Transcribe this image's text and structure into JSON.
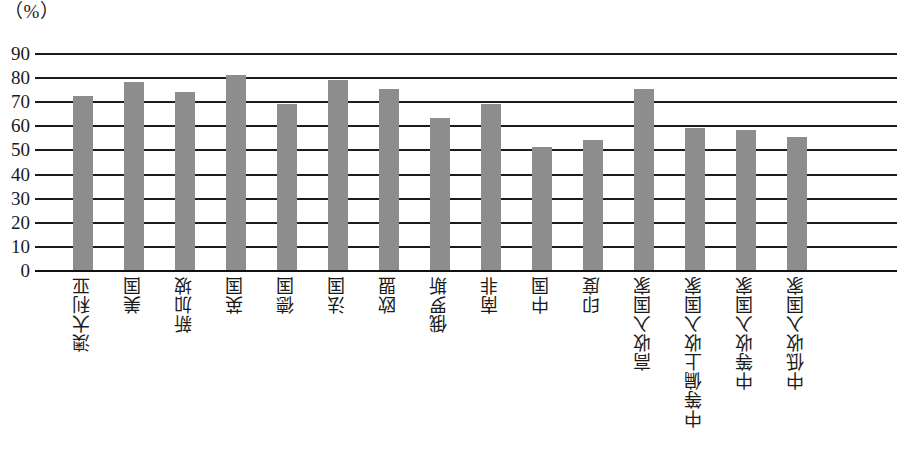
{
  "chart_data": {
    "type": "bar",
    "title": "",
    "subtitle": "",
    "xlabel": "",
    "ylabel": "",
    "unit_label": "（%）",
    "ylim": [
      0,
      90
    ],
    "ytick_step": 10,
    "yticks": [
      "90",
      "80",
      "70",
      "60",
      "50",
      "40",
      "30",
      "20",
      "10",
      "0"
    ],
    "grid": true,
    "legend": false,
    "legend_position": "none",
    "bar_color": "#8d8d8d",
    "axis_color": "#1c1c1c",
    "categories": [
      "澳大利亚",
      "美国",
      "新加坡",
      "英国",
      "德国",
      "法国",
      "欧盟",
      "俄罗斯",
      "南非",
      "中国",
      "印度",
      "高收入国家",
      "中等偏上收入国家",
      "中等收入国家",
      "中低收入国家"
    ],
    "values": [
      72,
      78,
      74,
      81,
      69,
      79,
      75,
      63,
      69,
      51,
      54,
      75,
      59,
      58,
      55
    ]
  }
}
